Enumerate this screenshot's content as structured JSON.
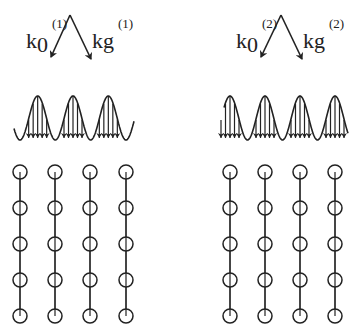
{
  "panels": [
    {
      "id": "panel-1",
      "incident_label": {
        "base": "k",
        "sub": "0",
        "sup": "(1)"
      },
      "diffracted_label": {
        "base": "k",
        "sub": "g",
        "sup": "(1)"
      },
      "standing_wave": {
        "peaks": 3,
        "phase": "antinodes-between-atoms"
      },
      "lattice": {
        "columns": 4,
        "rows": 5
      }
    },
    {
      "id": "panel-2",
      "incident_label": {
        "base": "k",
        "sub": "0",
        "sup": "(2)"
      },
      "diffracted_label": {
        "base": "k",
        "sub": "g",
        "sup": "(2)"
      },
      "standing_wave": {
        "peaks": 4,
        "phase": "antinodes-on-atoms"
      },
      "lattice": {
        "columns": 4,
        "rows": 5
      }
    }
  ]
}
